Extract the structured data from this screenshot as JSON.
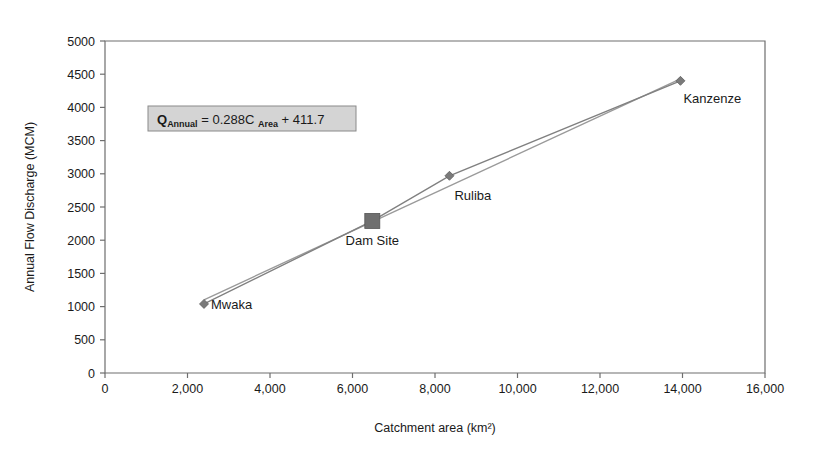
{
  "chart_data": {
    "type": "scatter",
    "title": "",
    "xlabel": "Catchment area (km²)",
    "ylabel": "Annual Flow Discharge (MCM)",
    "xlim": [
      0,
      16000
    ],
    "ylim": [
      0,
      5000
    ],
    "xticks": [
      0,
      2000,
      4000,
      6000,
      8000,
      10000,
      12000,
      14000,
      16000
    ],
    "xtick_labels": [
      "0",
      "2,000",
      "4,000",
      "6,000",
      "8,000",
      "10,000",
      "12,000",
      "14,000",
      "16,000"
    ],
    "yticks": [
      0,
      500,
      1000,
      1500,
      2000,
      2500,
      3000,
      3500,
      4000,
      4500,
      5000
    ],
    "ytick_labels": [
      "0",
      "500",
      "1000",
      "1500",
      "2000",
      "2500",
      "3000",
      "3500",
      "4000",
      "4500",
      "5000"
    ],
    "grid": false,
    "legend": "none",
    "points": [
      {
        "label": "Mwaka",
        "x": 2400,
        "y": 1040,
        "marker": "diamond"
      },
      {
        "label": "Dam Site",
        "x": 6480,
        "y": 2290,
        "marker": "square"
      },
      {
        "label": "Ruliba",
        "x": 8350,
        "y": 2970,
        "marker": "diamond"
      },
      {
        "label": "Kanzenze",
        "x": 13950,
        "y": 4400,
        "marker": "diamond"
      }
    ],
    "series": [
      {
        "name": "Observed stations",
        "style": "line-with-markers",
        "color": "#808080",
        "x": [
          2400,
          6480,
          8350,
          13950
        ],
        "values": [
          1040,
          2290,
          2970,
          4400
        ]
      },
      {
        "name": "Linear trendline",
        "style": "line",
        "color": "#9a9a9a",
        "slope": 0.288,
        "intercept": 411.7,
        "x": [
          2400,
          13950
        ],
        "values": [
          1102.9,
          4429.3
        ]
      }
    ],
    "annotations": [
      {
        "name": "regression-equation",
        "text": "Q_Annual = 0.288C_Area + 411.7",
        "parts": {
          "q": "Q",
          "q_sub": "Annual",
          "eq": "= 0.288C",
          "c_sub": "Area",
          "tail": "+ 411.7"
        },
        "box_fill": "#d4d4d4",
        "box_border": "#8a8a8a"
      }
    ]
  },
  "colors": {
    "axis": "#6e6e6e",
    "series": "#808080",
    "trend": "#9a9a9a",
    "marker": "#7a7a7a",
    "background": "#ffffff"
  }
}
